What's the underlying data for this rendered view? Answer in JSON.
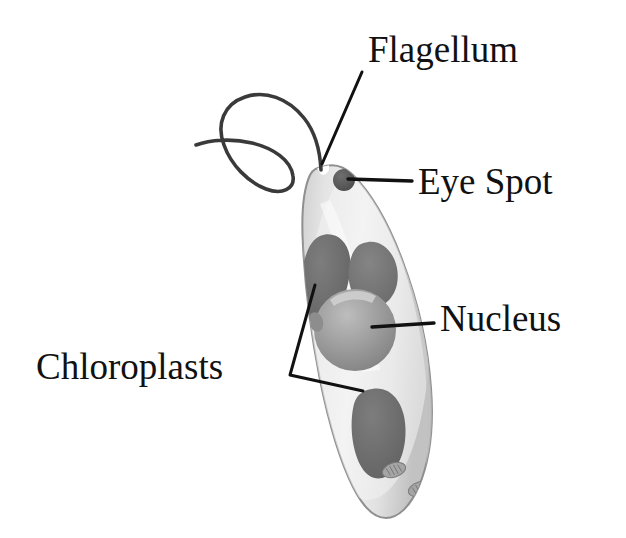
{
  "figure": {
    "background_color": "#ffffff",
    "width": 626,
    "height": 538
  },
  "labels": [
    {
      "id": "flagellum",
      "text": "Flagellum",
      "x": 368,
      "y": 62,
      "anchor": "start",
      "leader": "M 362 72 L 322 164"
    },
    {
      "id": "eye-spot",
      "text": "Eye Spot",
      "x": 418,
      "y": 194,
      "anchor": "start",
      "leader": "M 412 181 L 348 179"
    },
    {
      "id": "nucleus",
      "text": "Nucleus",
      "x": 440,
      "y": 331,
      "anchor": "start",
      "leader": "M 434 323 L 372 327"
    },
    {
      "id": "chloroplasts",
      "text": "Chloroplasts",
      "x": 36,
      "y": 379,
      "anchor": "start",
      "leader": "M 290 375 L 315 285 M 290 375 L 363 391"
    }
  ],
  "cell": {
    "name": "euglena-body",
    "outline_color": "#8a8a8a",
    "cytoplasm_color": "#e9e9e9",
    "cytoplasm_shadow_color": "#c9c9c9",
    "highlight_color": "#f7f7f7"
  },
  "organelles": [
    {
      "id": "eye-spot-organelle",
      "name": "eye-spot",
      "shape": "circle",
      "cx": 344,
      "cy": 180,
      "r": 11,
      "color": "#5e5e5e"
    },
    {
      "id": "chloroplast-upper-left",
      "name": "chloroplast",
      "shape": "blob",
      "color": "#6e6e6e"
    },
    {
      "id": "chloroplast-upper-right",
      "name": "chloroplast",
      "shape": "blob",
      "color": "#757575"
    },
    {
      "id": "chloroplast-lower",
      "name": "chloroplast",
      "shape": "blob",
      "color": "#6e6e6e"
    },
    {
      "id": "nucleus-organelle",
      "name": "nucleus",
      "shape": "circle",
      "cx": 355,
      "cy": 330,
      "r": 40,
      "color": "#9a9a9a"
    },
    {
      "id": "small-vacuole",
      "name": "contractile-vacuole",
      "shape": "oval",
      "cx": 316,
      "cy": 322,
      "rx": 7,
      "ry": 10,
      "color": "#8d8d8d"
    },
    {
      "id": "paramylon-body-1",
      "name": "paramylon-granule",
      "shape": "oval",
      "cx": 394,
      "cy": 470,
      "rx": 12,
      "ry": 7,
      "color": "#9e9e9e"
    },
    {
      "id": "paramylon-body-2",
      "name": "paramylon-granule",
      "shape": "oval",
      "cx": 420,
      "cy": 489,
      "rx": 12,
      "ry": 7,
      "color": "#9e9e9e"
    }
  ],
  "flagellum": {
    "name": "flagellum-strand",
    "color": "#3a3a3a",
    "stroke_width": 3.6,
    "path": "M 321 170 C 320 150 316 133 304 118 C 288 98 265 90 245 97 C 224 104 216 124 224 145 C 231 165 248 182 266 189 C 282 195 295 189 293 176 C 291 160 273 148 252 143 C 231 138 210 140 196 145"
  }
}
